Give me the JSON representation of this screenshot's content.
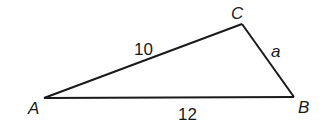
{
  "diagram": {
    "type": "triangle",
    "vertices": {
      "A": {
        "label": "A",
        "x": 44,
        "y": 98
      },
      "B": {
        "label": "B",
        "x": 294,
        "y": 97
      },
      "C": {
        "label": "C",
        "x": 242,
        "y": 24
      }
    },
    "sides": {
      "AC": {
        "label": "10"
      },
      "AB": {
        "label": "12"
      },
      "BC": {
        "label": "a"
      }
    },
    "colors": {
      "stroke": "#1a1a1a",
      "background": "#ffffff"
    }
  }
}
